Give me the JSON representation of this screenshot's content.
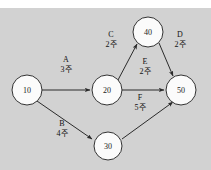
{
  "diagram": {
    "kind": "project-network-diagram",
    "background_color": "#d2d2d2",
    "top_strip_color": "#ffffff",
    "node_fill": "#fbfbfb",
    "node_stroke": "#333333",
    "edge_color": "#2b2b2b",
    "nodes": [
      {
        "id": "n10",
        "label": "10",
        "cx": 27,
        "cy": 90,
        "r": 15
      },
      {
        "id": "n20",
        "label": "20",
        "cx": 107,
        "cy": 90,
        "r": 15
      },
      {
        "id": "n30",
        "label": "30",
        "cx": 108,
        "cy": 146,
        "r": 14
      },
      {
        "id": "n40",
        "label": "40",
        "cx": 148,
        "cy": 32,
        "r": 15
      },
      {
        "id": "n50",
        "label": "50",
        "cx": 181,
        "cy": 90,
        "r": 15
      }
    ],
    "edges": [
      {
        "id": "eA",
        "name": "A",
        "duration": "3주",
        "from": "10",
        "to": "20",
        "name_x": 66,
        "name_y": 62,
        "dur_x": 66,
        "dur_y": 72
      },
      {
        "id": "eB",
        "name": "B",
        "duration": "4주",
        "from": "10",
        "to": "30",
        "name_x": 62,
        "name_y": 126,
        "dur_x": 62,
        "dur_y": 136
      },
      {
        "id": "eC",
        "name": "C",
        "duration": "2주",
        "from": "20",
        "to": "40",
        "name_x": 111,
        "name_y": 37,
        "dur_x": 111,
        "dur_y": 47
      },
      {
        "id": "eD",
        "name": "D",
        "duration": "2주",
        "from": "40",
        "to": "50",
        "name_x": 180,
        "name_y": 37,
        "dur_x": 180,
        "dur_y": 47
      },
      {
        "id": "eE",
        "name": "E",
        "duration": "2주",
        "from": "20",
        "to": "50",
        "name_x": 145,
        "name_y": 64,
        "dur_x": 145,
        "dur_y": 74
      },
      {
        "id": "eF",
        "name": "F",
        "duration": "5주",
        "from": "30",
        "to": "50",
        "name_x": 140,
        "name_y": 100,
        "dur_x": 140,
        "dur_y": 110
      }
    ]
  }
}
